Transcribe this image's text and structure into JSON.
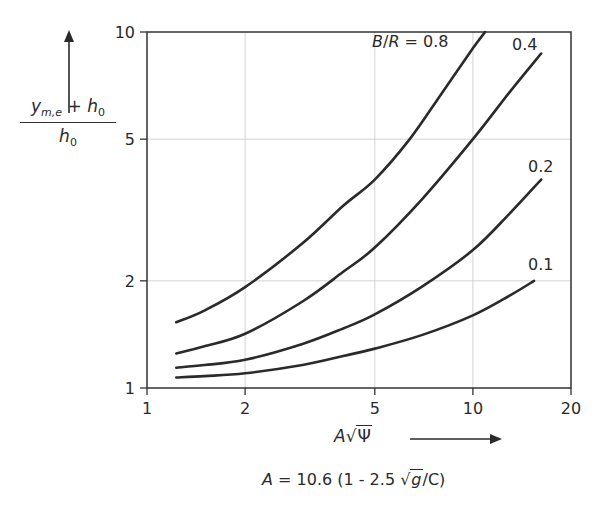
{
  "chart_data": {
    "type": "line",
    "title": "",
    "xscale": "log",
    "yscale": "log",
    "xlim": [
      1,
      20
    ],
    "ylim": [
      1,
      10
    ],
    "grid": true,
    "x_ticks": [
      1,
      2,
      5,
      10,
      20
    ],
    "x_tick_labels": [
      "1",
      "2",
      "5",
      "10",
      "20"
    ],
    "y_ticks": [
      1,
      2,
      5,
      10
    ],
    "y_tick_labels": [
      "1",
      "2",
      "5",
      "10"
    ],
    "xlabel": "A√Ψ",
    "ylabel": "(y_m,e + h_0) / h_0",
    "legend_title": "B/R",
    "series": [
      {
        "name": "B/R = 0.8",
        "label": "B/R = 0.8",
        "x": [
          1.23,
          1.5,
          2,
          3,
          4,
          5,
          6.4,
          8,
          10,
          10.9
        ],
        "y": [
          1.53,
          1.65,
          1.92,
          2.55,
          3.25,
          3.85,
          5.0,
          6.7,
          9.0,
          10.0
        ]
      },
      {
        "name": "B/R = 0.4",
        "label": "0.4",
        "x": [
          1.23,
          1.5,
          2,
          3,
          4,
          5,
          7,
          10,
          13,
          16.2
        ],
        "y": [
          1.25,
          1.31,
          1.42,
          1.75,
          2.12,
          2.48,
          3.4,
          5.0,
          6.8,
          8.7
        ]
      },
      {
        "name": "B/R = 0.2",
        "label": "0.2",
        "x": [
          1.23,
          1.5,
          2,
          3,
          4,
          5,
          7,
          10,
          13,
          16.2
        ],
        "y": [
          1.14,
          1.16,
          1.2,
          1.33,
          1.47,
          1.61,
          1.93,
          2.44,
          3.1,
          3.85
        ]
      },
      {
        "name": "B/R = 0.1",
        "label": "0.1",
        "x": [
          1.23,
          1.5,
          2,
          3,
          4,
          5,
          7,
          10,
          13,
          15.4
        ],
        "y": [
          1.07,
          1.08,
          1.1,
          1.16,
          1.23,
          1.29,
          1.41,
          1.6,
          1.82,
          2.0
        ]
      }
    ],
    "annotation": "A = 10.6 (1 - 2.5 √g/C)"
  },
  "labels": {
    "ylabel_num_y": "y",
    "ylabel_num_sub": "m,e",
    "ylabel_plus": " + ",
    "ylabel_h": "h",
    "ylabel_sub0": "0",
    "xlabel_A": "A",
    "xlabel_sqrt": "√",
    "xlabel_psi": "Ψ",
    "formula_A": "A",
    "formula_mid": " = 10.6 (1 - 2.5 ",
    "formula_sqrt": "√",
    "formula_g": "g",
    "formula_end": "/C)"
  }
}
